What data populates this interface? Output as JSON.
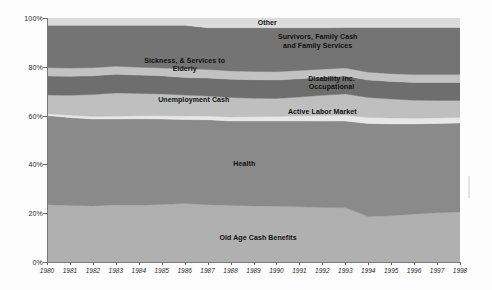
{
  "chart_data": {
    "type": "area",
    "title": "",
    "subtitle": "",
    "xlabel": "",
    "ylabel": "",
    "stacked": true,
    "normalized": true,
    "grid": false,
    "legend_position": "inline-labels",
    "ylim": [
      0,
      100
    ],
    "ytick_labels": [
      "0%",
      "20%",
      "40%",
      "60%",
      "80%",
      "100%"
    ],
    "ytick_values": [
      0,
      20,
      40,
      60,
      80,
      100
    ],
    "x": [
      1980,
      1981,
      1982,
      1983,
      1984,
      1985,
      1986,
      1987,
      1988,
      1989,
      1990,
      1991,
      1992,
      1993,
      1994,
      1995,
      1996,
      1997,
      1998
    ],
    "xtick_labels": [
      "1980",
      "1981",
      "1982",
      "1983",
      "1984",
      "1985",
      "1986",
      "1987",
      "1988",
      "1989",
      "1990",
      "1991",
      "1992",
      "1993",
      "1994",
      "1995",
      "1996",
      "1997",
      "1998"
    ],
    "series": [
      {
        "name": "Old Age Cash Benefits",
        "color": "#b0b0b0",
        "label_position": {
          "x": 1989.2,
          "y": 10
        },
        "values": [
          23.5,
          23.2,
          23.0,
          23.4,
          23.3,
          23.6,
          24.0,
          23.5,
          23.2,
          23.0,
          22.8,
          22.6,
          22.4,
          22.2,
          18.6,
          19.0,
          19.6,
          20.2,
          20.5
        ]
      },
      {
        "name": "Health",
        "color": "#8a8a8a",
        "label_position": {
          "x": 1988.6,
          "y": 40
        },
        "values": [
          36.5,
          36.0,
          35.6,
          35.2,
          35.4,
          35.0,
          34.4,
          34.8,
          34.6,
          34.8,
          35.0,
          35.2,
          35.4,
          35.6,
          38.2,
          37.6,
          37.0,
          36.6,
          36.5
        ]
      },
      {
        "name": "Active Labor Market",
        "color": "#e8e8e8",
        "label_position": {
          "x": 1992.0,
          "y": 61.5
        },
        "values": [
          0.8,
          0.9,
          1.0,
          1.1,
          1.2,
          1.3,
          1.4,
          1.5,
          1.6,
          1.7,
          1.8,
          2.0,
          2.2,
          2.3,
          2.4,
          2.4,
          2.3,
          2.2,
          2.2
        ]
      },
      {
        "name": "Unemployment Cash",
        "color": "#bfbfbf",
        "label_position": {
          "x": 1986.4,
          "y": 66.5
        },
        "values": [
          7.6,
          8.2,
          9.0,
          9.6,
          9.2,
          9.0,
          8.6,
          8.2,
          8.0,
          7.6,
          7.4,
          7.8,
          8.4,
          8.8,
          8.2,
          7.8,
          7.4,
          7.2,
          7.0
        ]
      },
      {
        "name": "Disability inc. Occupational",
        "color": "#6e6e6e",
        "label_position": {
          "x": 1992.4,
          "y": 73.5
        },
        "values": [
          7.8,
          7.8,
          7.7,
          7.6,
          7.5,
          7.4,
          7.2,
          7.4,
          7.5,
          7.6,
          7.6,
          7.5,
          7.4,
          7.3,
          7.2,
          7.2,
          7.3,
          7.4,
          7.4
        ]
      },
      {
        "name": "Sickness, & Services to Elderly",
        "color": "#c2c2c2",
        "label_position": {
          "x": 1986.0,
          "y": 80.8
        },
        "values": [
          3.4,
          3.4,
          3.3,
          3.3,
          3.2,
          3.2,
          3.6,
          3.5,
          3.4,
          3.4,
          3.4,
          3.4,
          3.3,
          3.3,
          3.2,
          3.2,
          3.2,
          3.2,
          3.2
        ]
      },
      {
        "name": "Survivors, Family Cash and Family Services",
        "color": "#747474",
        "label_position": {
          "x": 1991.8,
          "y": 90.5
        },
        "values": [
          17.4,
          17.5,
          17.4,
          16.8,
          17.2,
          17.5,
          17.8,
          17.1,
          17.7,
          17.9,
          18.0,
          17.5,
          17.0,
          16.6,
          18.3,
          18.9,
          19.3,
          19.3,
          19.3
        ]
      },
      {
        "name": "Other",
        "color": "#dcdcdc",
        "label_position": {
          "x": 1989.6,
          "y": 98.0
        },
        "values": [
          3.0,
          3.0,
          3.0,
          3.0,
          3.0,
          3.0,
          3.0,
          4.0,
          4.0,
          4.0,
          4.0,
          4.0,
          4.0,
          3.9,
          3.9,
          3.9,
          3.9,
          3.9,
          3.9
        ]
      }
    ]
  },
  "labels": {
    "old_age": "Old Age Cash Benefits",
    "health": "Health",
    "active_labor": "Active Labor Market",
    "unemployment": "Unemployment Cash",
    "disability": "Disability inc.\nOccupational",
    "sickness": "Sickness, & Services to\nElderly",
    "survivors": "Survivors, Family Cash\nand Family Services",
    "other": "Other"
  },
  "colors": {
    "background": "#fdfdfd",
    "axis": "#6b6b6b",
    "text": "#2a2a2a"
  }
}
